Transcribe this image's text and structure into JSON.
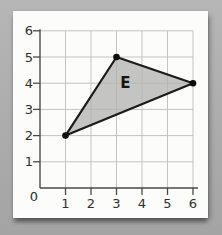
{
  "figure": {
    "background_color": "#acacac",
    "card_color": "#fcfcfa"
  },
  "chart_data": {
    "type": "scatter",
    "title": "",
    "xlabel": "",
    "ylabel": "",
    "xlim": [
      0,
      6
    ],
    "ylim": [
      0,
      6
    ],
    "grid": true,
    "x_tick_labels": [
      "1",
      "2",
      "3",
      "4",
      "5",
      "6"
    ],
    "y_tick_labels": [
      "1",
      "2",
      "3",
      "4",
      "5",
      "6"
    ],
    "origin_label": "0",
    "shape": "triangle",
    "shape_label": "E",
    "shape_label_pos": [
      3.35,
      4.0
    ],
    "points": [
      [
        1,
        2
      ],
      [
        3,
        5
      ],
      [
        6,
        4
      ]
    ],
    "fill_color": "#b3b3b3",
    "fill_opacity": 0.78,
    "edge_color": "#1b1b1b",
    "vertex_color": "#0d0d0d",
    "grid_color": "#c3c3c3",
    "axis_color": "#4a4a4a",
    "label_color": "#2e2e2e"
  }
}
